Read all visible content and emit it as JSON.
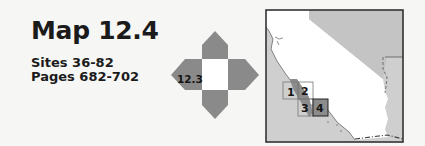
{
  "header": {
    "title": "Map 12.4",
    "sites": "Sites 36-82",
    "pages": "Pages 682-702"
  },
  "navigator": {
    "west_label": "12.3",
    "arrow_color": "#8a8a8a",
    "center_color": "#ffffff"
  },
  "locator_map": {
    "land_color": "#ffffff",
    "outside_color": "#c9c9c9",
    "highlight_color": "#8c8c8c",
    "grid": [
      {
        "label": "1",
        "active": false
      },
      {
        "label": "2",
        "active": false
      },
      {
        "label": "3",
        "active": false
      },
      {
        "label": "4",
        "active": true
      }
    ]
  }
}
